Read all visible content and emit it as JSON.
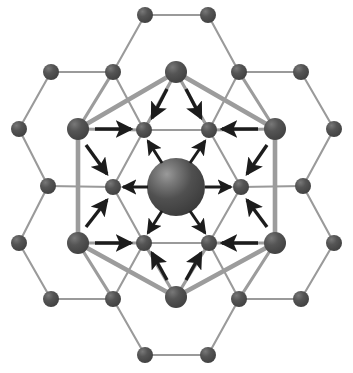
{
  "figure": {
    "canvas": {
      "width": 353,
      "height": 373,
      "background": "#ffffff"
    },
    "colors": {
      "node_fill": "#4a4a4a",
      "node_fill_light": "#5c5c5c",
      "node_highlight": "#8a8a8a",
      "thin_bond": "#9a9a9a",
      "thick_bond": "#9c9c9c",
      "arrow": "#1c1c1c",
      "center_sphere_dark": "#3c3c3c",
      "center_sphere_light": "#8d8d8d"
    },
    "center_atom": {
      "label": "interstitial-atom",
      "cx": 176,
      "cy": 187,
      "r": 29
    },
    "ring_vertices": {
      "label": "displaced-ring-atoms",
      "r": 11,
      "points": [
        {
          "name": "top",
          "cx": 176,
          "cy": 72
        },
        {
          "name": "upper-right",
          "cx": 275,
          "cy": 129
        },
        {
          "name": "lower-right",
          "cx": 275,
          "cy": 243
        },
        {
          "name": "bottom",
          "cx": 176,
          "cy": 297
        },
        {
          "name": "lower-left",
          "cx": 78,
          "cy": 243
        },
        {
          "name": "upper-left",
          "cx": 78,
          "cy": 129
        }
      ]
    },
    "inner_hexagon_atoms": {
      "label": "first-shell-atoms",
      "r": 8,
      "points": [
        {
          "name": "inner-upper-left",
          "cx": 144,
          "cy": 130
        },
        {
          "name": "inner-upper-right",
          "cx": 209,
          "cy": 130
        },
        {
          "name": "inner-right",
          "cx": 241,
          "cy": 187
        },
        {
          "name": "inner-lower-right",
          "cx": 209,
          "cy": 243
        },
        {
          "name": "inner-lower-left",
          "cx": 144,
          "cy": 243
        },
        {
          "name": "inner-left",
          "cx": 113,
          "cy": 187
        }
      ]
    },
    "outer_atoms": {
      "label": "outer-lattice-atoms",
      "r": 8,
      "points": [
        {
          "name": "outer-top-left",
          "cx": 145,
          "cy": 15
        },
        {
          "name": "outer-top-right",
          "cx": 208,
          "cy": 15
        },
        {
          "name": "outer-upper-left-far",
          "cx": 51,
          "cy": 72
        },
        {
          "name": "outer-upper-left-in",
          "cx": 113,
          "cy": 72
        },
        {
          "name": "outer-upper-right-in",
          "cx": 239,
          "cy": 72
        },
        {
          "name": "outer-upper-right-far",
          "cx": 301,
          "cy": 72
        },
        {
          "name": "outer-left-mid",
          "cx": 19,
          "cy": 129
        },
        {
          "name": "outer-right-mid",
          "cx": 334,
          "cy": 129
        },
        {
          "name": "outer-left-center",
          "cx": 19,
          "cy": 243
        },
        {
          "name": "outer-right-center",
          "cx": 334,
          "cy": 243
        },
        {
          "name": "outer-mid-left",
          "cx": 48,
          "cy": 186
        },
        {
          "name": "outer-mid-right",
          "cx": 303,
          "cy": 186
        },
        {
          "name": "outer-lower-left-far",
          "cx": 51,
          "cy": 299
        },
        {
          "name": "outer-lower-left-in",
          "cx": 113,
          "cy": 299
        },
        {
          "name": "outer-lower-right-in",
          "cx": 239,
          "cy": 299
        },
        {
          "name": "outer-lower-right-far",
          "cx": 301,
          "cy": 299
        },
        {
          "name": "outer-bottom-left",
          "cx": 145,
          "cy": 355
        },
        {
          "name": "outer-bottom-right",
          "cx": 208,
          "cy": 355
        }
      ]
    },
    "thin_bonds": [
      {
        "x1": 145,
        "y1": 15,
        "x2": 208,
        "y2": 15
      },
      {
        "x1": 145,
        "y1": 15,
        "x2": 113,
        "y2": 72
      },
      {
        "x1": 208,
        "y1": 15,
        "x2": 239,
        "y2": 72
      },
      {
        "x1": 51,
        "y1": 72,
        "x2": 113,
        "y2": 72
      },
      {
        "x1": 239,
        "y1": 72,
        "x2": 301,
        "y2": 72
      },
      {
        "x1": 51,
        "y1": 72,
        "x2": 19,
        "y2": 129
      },
      {
        "x1": 301,
        "y1": 72,
        "x2": 334,
        "y2": 129
      },
      {
        "x1": 113,
        "y1": 72,
        "x2": 144,
        "y2": 130
      },
      {
        "x1": 239,
        "y1": 72,
        "x2": 209,
        "y2": 130
      },
      {
        "x1": 19,
        "y1": 129,
        "x2": 48,
        "y2": 186
      },
      {
        "x1": 334,
        "y1": 129,
        "x2": 303,
        "y2": 186
      },
      {
        "x1": 48,
        "y1": 186,
        "x2": 113,
        "y2": 187
      },
      {
        "x1": 303,
        "y1": 186,
        "x2": 241,
        "y2": 187
      },
      {
        "x1": 48,
        "y1": 186,
        "x2": 19,
        "y2": 243
      },
      {
        "x1": 303,
        "y1": 186,
        "x2": 334,
        "y2": 243
      },
      {
        "x1": 19,
        "y1": 243,
        "x2": 51,
        "y2": 299
      },
      {
        "x1": 334,
        "y1": 243,
        "x2": 301,
        "y2": 299
      },
      {
        "x1": 51,
        "y1": 299,
        "x2": 113,
        "y2": 299
      },
      {
        "x1": 301,
        "y1": 299,
        "x2": 239,
        "y2": 299
      },
      {
        "x1": 113,
        "y1": 299,
        "x2": 145,
        "y2": 355
      },
      {
        "x1": 239,
        "y1": 299,
        "x2": 208,
        "y2": 355
      },
      {
        "x1": 145,
        "y1": 355,
        "x2": 208,
        "y2": 355
      },
      {
        "x1": 113,
        "y1": 299,
        "x2": 144,
        "y2": 243
      },
      {
        "x1": 239,
        "y1": 299,
        "x2": 209,
        "y2": 243
      },
      {
        "x1": 144,
        "y1": 130,
        "x2": 209,
        "y2": 130
      },
      {
        "x1": 209,
        "y1": 130,
        "x2": 241,
        "y2": 187
      },
      {
        "x1": 241,
        "y1": 187,
        "x2": 209,
        "y2": 243
      },
      {
        "x1": 209,
        "y1": 243,
        "x2": 144,
        "y2": 243
      },
      {
        "x1": 144,
        "y1": 243,
        "x2": 113,
        "y2": 187
      },
      {
        "x1": 113,
        "y1": 187,
        "x2": 144,
        "y2": 130
      }
    ],
    "medium_bonds": [
      {
        "x1": 78,
        "y1": 129,
        "x2": 113,
        "y2": 72
      },
      {
        "x1": 275,
        "y1": 129,
        "x2": 239,
        "y2": 72
      },
      {
        "x1": 78,
        "y1": 243,
        "x2": 113,
        "y2": 299
      },
      {
        "x1": 275,
        "y1": 243,
        "x2": 239,
        "y2": 299
      },
      {
        "x1": 78,
        "y1": 129,
        "x2": 144,
        "y2": 130
      },
      {
        "x1": 275,
        "y1": 129,
        "x2": 209,
        "y2": 130
      },
      {
        "x1": 78,
        "y1": 243,
        "x2": 144,
        "y2": 243
      },
      {
        "x1": 275,
        "y1": 243,
        "x2": 209,
        "y2": 243
      },
      {
        "x1": 176,
        "y1": 72,
        "x2": 144,
        "y2": 130
      },
      {
        "x1": 176,
        "y1": 72,
        "x2": 209,
        "y2": 130
      },
      {
        "x1": 176,
        "y1": 297,
        "x2": 144,
        "y2": 243
      },
      {
        "x1": 176,
        "y1": 297,
        "x2": 209,
        "y2": 243
      }
    ],
    "thick_ring_bonds": [
      {
        "x1": 176,
        "y1": 72,
        "x2": 275,
        "y2": 129
      },
      {
        "x1": 275,
        "y1": 129,
        "x2": 275,
        "y2": 243
      },
      {
        "x1": 275,
        "y1": 243,
        "x2": 176,
        "y2": 297
      },
      {
        "x1": 176,
        "y1": 297,
        "x2": 78,
        "y2": 243
      },
      {
        "x1": 78,
        "y1": 243,
        "x2": 78,
        "y2": 129
      },
      {
        "x1": 78,
        "y1": 129,
        "x2": 176,
        "y2": 72
      }
    ],
    "arrows": {
      "label": "displacement-arrows",
      "outward_from_center": [
        {
          "name": "arrow-center-to-left",
          "x1": 148,
          "y1": 187,
          "x2": 123,
          "y2": 187
        },
        {
          "name": "arrow-center-to-right",
          "x1": 205,
          "y1": 187,
          "x2": 231,
          "y2": 187
        },
        {
          "name": "arrow-center-to-upper-left",
          "x1": 162,
          "y1": 163,
          "x2": 148,
          "y2": 141
        },
        {
          "name": "arrow-center-to-upper-right",
          "x1": 190,
          "y1": 163,
          "x2": 205,
          "y2": 141
        },
        {
          "name": "arrow-center-to-lower-left",
          "x1": 162,
          "y1": 211,
          "x2": 148,
          "y2": 233
        },
        {
          "name": "arrow-center-to-lower-right",
          "x1": 190,
          "y1": 211,
          "x2": 205,
          "y2": 233
        }
      ],
      "inward_from_ring": [
        {
          "name": "arrow-top-to-inner-upper-left",
          "x1": 167,
          "y1": 89,
          "x2": 152,
          "y2": 118
        },
        {
          "name": "arrow-top-to-inner-upper-right",
          "x1": 186,
          "y1": 89,
          "x2": 201,
          "y2": 118
        },
        {
          "name": "arrow-bottom-to-inner-lower-left",
          "x1": 167,
          "y1": 280,
          "x2": 152,
          "y2": 253
        },
        {
          "name": "arrow-bottom-to-inner-lower-right",
          "x1": 186,
          "y1": 280,
          "x2": 201,
          "y2": 253
        },
        {
          "name": "arrow-upper-left-to-inner-upper-left",
          "x1": 95,
          "y1": 129,
          "x2": 131,
          "y2": 129
        },
        {
          "name": "arrow-lower-left-to-inner-lower-left",
          "x1": 95,
          "y1": 243,
          "x2": 131,
          "y2": 243
        },
        {
          "name": "arrow-upper-right-to-inner-upper-right",
          "x1": 258,
          "y1": 129,
          "x2": 222,
          "y2": 129
        },
        {
          "name": "arrow-lower-right-to-inner-lower-right",
          "x1": 258,
          "y1": 243,
          "x2": 222,
          "y2": 243
        },
        {
          "name": "arrow-upper-left-to-inner-left",
          "x1": 86,
          "y1": 145,
          "x2": 107,
          "y2": 174
        },
        {
          "name": "arrow-lower-left-to-inner-left",
          "x1": 86,
          "y1": 227,
          "x2": 107,
          "y2": 200
        },
        {
          "name": "arrow-upper-right-to-inner-right",
          "x1": 267,
          "y1": 145,
          "x2": 247,
          "y2": 174
        },
        {
          "name": "arrow-lower-right-to-inner-right",
          "x1": 267,
          "y1": 227,
          "x2": 247,
          "y2": 200
        }
      ]
    }
  }
}
